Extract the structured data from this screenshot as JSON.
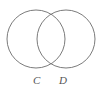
{
  "figure": {
    "kind": "venn-diagram",
    "background_color": "#ffffff",
    "stroke_color": "#7b7b7b",
    "label_color": "#555555",
    "width": 105,
    "height": 92
  },
  "sets": [
    {
      "id": "c",
      "label": "C",
      "center_x": 36,
      "center_y": 39,
      "radius": 29
    },
    {
      "id": "d",
      "label": "D",
      "center_x": 66,
      "center_y": 39,
      "radius": 29
    }
  ]
}
